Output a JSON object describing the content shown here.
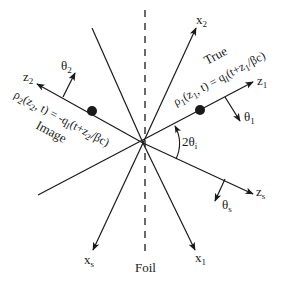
{
  "figure": {
    "type": "geometry-diagram",
    "colors": {
      "line": "#1a1a1a",
      "background": "#ffffff"
    },
    "center": [
      143,
      143
    ],
    "foil": {
      "label": "Foil",
      "style": "dashed"
    },
    "axes": {
      "x1": {
        "base": "x",
        "sub": "1"
      },
      "x2": {
        "base": "x",
        "sub": "2"
      },
      "xs": {
        "base": "x",
        "sub": "s"
      },
      "z1": {
        "base": "z",
        "sub": "1"
      },
      "z2": {
        "base": "z",
        "sub": "2"
      },
      "zs": {
        "base": "z",
        "sub": "s"
      }
    },
    "angles": {
      "theta1": {
        "base": "θ",
        "sub": "1"
      },
      "theta2": {
        "base": "θ",
        "sub": "2"
      },
      "thetas": {
        "base": "θ",
        "sub": "s"
      },
      "incidence": {
        "prefix": "2θ",
        "sub": "i"
      }
    },
    "labels": {
      "true": "True",
      "image": "Image"
    },
    "equations": {
      "rho1": {
        "lhs": "ρ",
        "lhs_sub": "1",
        "args_a": "(z",
        "args_a_sub": "1",
        "args_b": ", t) = q",
        "q_sub": "I",
        "rhs_a": "(t+z",
        "rhs_sub": "1",
        "rhs_b": "/βc)"
      },
      "rho2": {
        "lhs": "ρ",
        "lhs_sub": "2",
        "args_a": "(z",
        "args_a_sub": "2",
        "args_b": ", t) = -q",
        "q_sub": "I",
        "rhs_a": "(t+z",
        "rhs_sub": "2",
        "rhs_b": "/βc)"
      }
    }
  }
}
